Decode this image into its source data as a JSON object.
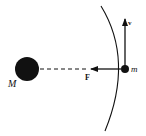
{
  "diagram": {
    "type": "physics-orbit-force-diagram",
    "colors": {
      "ink": "#111111",
      "background": "#ffffff"
    },
    "central_body": {
      "label": "M",
      "cx": 27,
      "cy": 69,
      "r": 12
    },
    "orbiting_body": {
      "label": "m",
      "cx": 125,
      "cy": 69,
      "r": 4
    },
    "force_vector": {
      "label": "F",
      "direction": "toward M",
      "style": "solid arrow, continued as dashed line to M"
    },
    "velocity_vector": {
      "label": "v",
      "direction": "tangent, upward"
    },
    "orbit_path": {
      "style": "curved arc passing through m"
    }
  }
}
